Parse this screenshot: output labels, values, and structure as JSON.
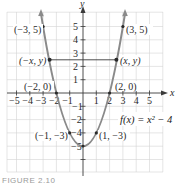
{
  "figure": {
    "function_label": "f(x) = x² − 4",
    "axis_labels": {
      "x": "x",
      "y": "y"
    },
    "x_ticks": [
      "−5",
      "−4",
      "−3",
      "−2",
      "−1",
      "1",
      "2",
      "3",
      "4",
      "5"
    ],
    "y_ticks": [
      "5",
      "4",
      "3",
      "2",
      "1",
      "−1",
      "−2",
      "−4",
      "−5"
    ],
    "points": {
      "p_neg3_5": "(−3, 5)",
      "p_3_5": "(3, 5)",
      "p_negx_y": "(−x, y)",
      "p_x_y": "(x, y)",
      "p_neg2_0": "(−2, 0)",
      "p_2_0": "(2, 0)",
      "p_neg1_neg3": "(−1, −3)",
      "p_1_neg3": "(1, −3)"
    },
    "caption": "FIGURE 2.10"
  },
  "colors": {
    "curve": "#8a8a8a",
    "axis": "#3a3a3a",
    "grid": "#d4d4d4"
  }
}
